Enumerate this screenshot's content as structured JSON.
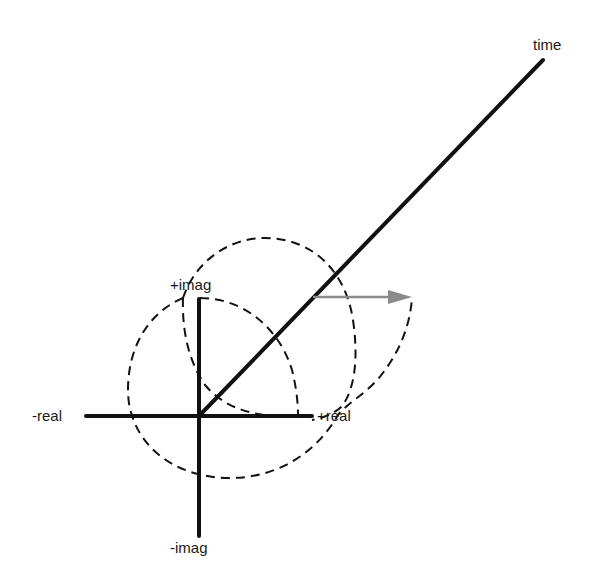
{
  "diagram": {
    "labels": {
      "time": "time",
      "plus_imag": "+imag",
      "minus_imag": "-imag",
      "minus_real": "-real",
      "plus_real": "+real"
    },
    "colors": {
      "axes": "#111111",
      "dashed_paths": "#111111",
      "arrow": "#8a8a8a",
      "background": "#ffffff"
    },
    "geometry": {
      "origin": [
        199,
        416
      ],
      "real_axis": {
        "from": [
          86,
          416
        ],
        "to": [
          312,
          416
        ]
      },
      "imag_axis": {
        "from": [
          199,
          299
        ],
        "to": [
          199,
          536
        ]
      },
      "time_axis": {
        "from": [
          199,
          416
        ],
        "to": [
          543,
          60
        ]
      },
      "gray_arrow": {
        "from": [
          313,
          297
        ],
        "to": [
          412,
          297
        ]
      }
    }
  }
}
